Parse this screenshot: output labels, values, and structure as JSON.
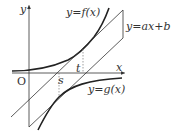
{
  "diagram": {
    "labels": {
      "y_axis": "y",
      "x_axis": "x",
      "origin": "O",
      "f_curve": "y=f(x)",
      "g_curve": "y=g(x)",
      "line": "y=ax+b",
      "s": "s",
      "t": "t"
    },
    "colors": {
      "stroke": "#333333",
      "curve": "#222222",
      "dashed": "#777777"
    }
  }
}
